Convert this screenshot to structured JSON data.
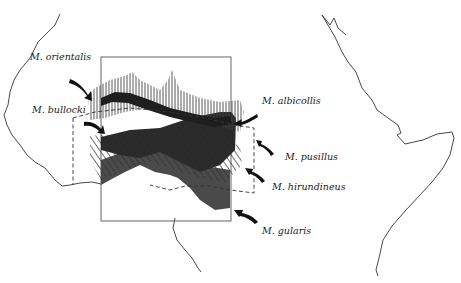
{
  "figure": {
    "colors": {
      "coastline": "#333333",
      "dark_fill": "#2a2a2a",
      "mid_fill": "#4a4a4a",
      "hatch": "#444444",
      "frame": "#555555"
    }
  },
  "species_labels": [
    {
      "id": "orientalis",
      "label": "M. orientalis",
      "x": 30,
      "y": 55
    },
    {
      "id": "bullocki",
      "label": "M. bullocki",
      "x": 32,
      "y": 108
    },
    {
      "id": "albicollis",
      "label": "M. albicollis",
      "x": 262,
      "y": 99
    },
    {
      "id": "pusillus",
      "label": "M. pusillus",
      "x": 285,
      "y": 155
    },
    {
      "id": "hirundineus",
      "label": "M. hirundineus",
      "x": 272,
      "y": 185
    },
    {
      "id": "gularis",
      "label": "M. gularis",
      "x": 262,
      "y": 229
    }
  ]
}
